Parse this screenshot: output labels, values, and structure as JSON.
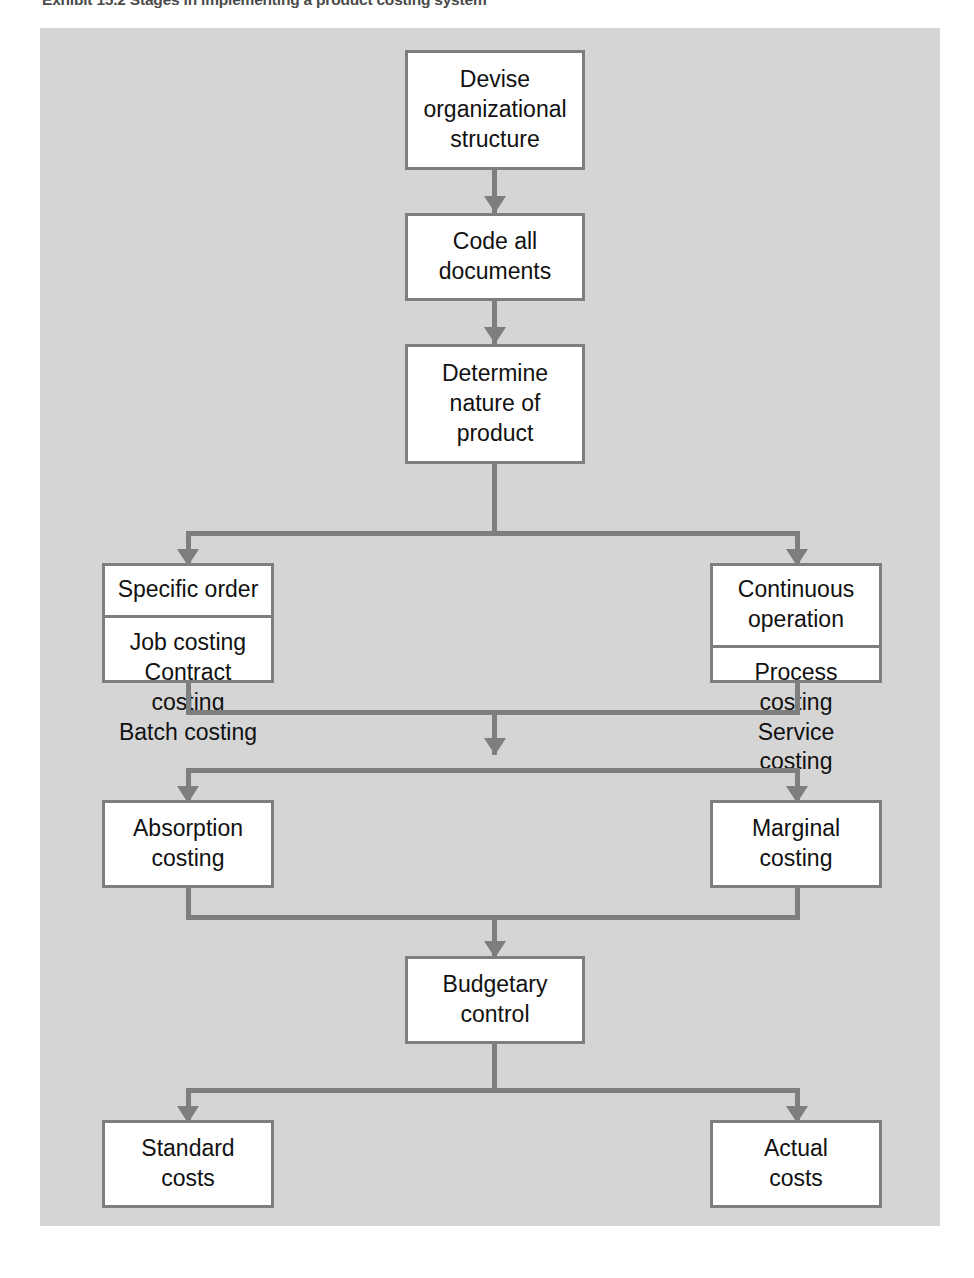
{
  "exhibit": {
    "title": "Exhibit 15.2 Stages in implementing a product costing system"
  },
  "diagram": {
    "type": "flowchart",
    "orientation": "top-to-bottom",
    "background_color": "#d5d5d5",
    "node_fill_color": "#ffffff",
    "node_border_color": "#7e7e7e",
    "connector_color": "#7e7e7e",
    "text_color": "#111111",
    "nodes": [
      {
        "id": "devise",
        "label": "Devise\norganizational\nstructure"
      },
      {
        "id": "code",
        "label": "Code all\ndocuments"
      },
      {
        "id": "determine",
        "label": "Determine\nnature of\nproduct"
      },
      {
        "id": "specific",
        "head": "Specific order",
        "body": "Job costing\nContract costing\nBatch costing"
      },
      {
        "id": "continuous",
        "head": "Continuous\noperation",
        "body": "Process costing\nService costing"
      },
      {
        "id": "absorption",
        "label": "Absorption\ncosting"
      },
      {
        "id": "marginal",
        "label": "Marginal\ncosting"
      },
      {
        "id": "budgetary",
        "label": "Budgetary\ncontrol"
      },
      {
        "id": "standard",
        "label": "Standard\ncosts"
      },
      {
        "id": "actual",
        "label": "Actual\ncosts"
      }
    ],
    "edges": [
      {
        "from": "devise",
        "to": "code"
      },
      {
        "from": "code",
        "to": "determine"
      },
      {
        "from": "determine",
        "to": "specific"
      },
      {
        "from": "determine",
        "to": "continuous"
      },
      {
        "from": "specific",
        "to": "absorption"
      },
      {
        "from": "specific",
        "to": "marginal"
      },
      {
        "from": "continuous",
        "to": "absorption"
      },
      {
        "from": "continuous",
        "to": "marginal"
      },
      {
        "from": "absorption",
        "to": "budgetary"
      },
      {
        "from": "marginal",
        "to": "budgetary"
      },
      {
        "from": "budgetary",
        "to": "standard"
      },
      {
        "from": "budgetary",
        "to": "actual"
      }
    ]
  }
}
